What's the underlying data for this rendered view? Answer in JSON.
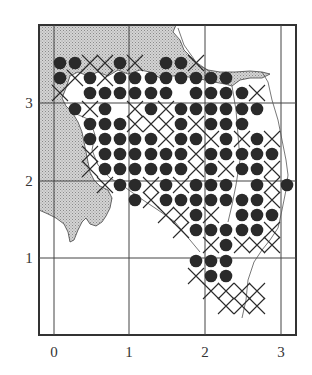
{
  "figure": {
    "x_axis": {
      "ticks": [
        "0",
        "1",
        "2",
        "3"
      ]
    },
    "y_axis": {
      "ticks": [
        "1",
        "2",
        "3"
      ]
    }
  },
  "colors": {
    "land": "#c8c8c8",
    "ink": "#2a2a2a",
    "background": "#ffffff"
  },
  "legend_semantics": {
    "dot": "filled-circle-marker",
    "cross": "x-marker"
  },
  "grid": {
    "cols_x": [
      60,
      75,
      90,
      105,
      120,
      135,
      151,
      166,
      181,
      196,
      211,
      226,
      242,
      257,
      272,
      287
    ],
    "rows_y": [
      63,
      78,
      93,
      109,
      124,
      139,
      154,
      169,
      185,
      200,
      215,
      230,
      245,
      261,
      276,
      291,
      306
    ]
  },
  "markers": {
    "rows": [
      {
        "dots": [
          0,
          1,
          4,
          7,
          8
        ],
        "crosses": [
          2,
          3,
          5,
          9
        ]
      },
      {
        "dots": [
          0,
          2,
          4,
          5,
          6,
          7,
          8,
          9,
          10,
          11
        ],
        "crosses": [
          1,
          3
        ]
      },
      {
        "dots": [
          2,
          3,
          4,
          5,
          6,
          7,
          9,
          10,
          11,
          12
        ],
        "crosses": [
          0,
          13
        ]
      },
      {
        "dots": [
          1,
          3,
          6,
          8,
          9,
          10,
          11,
          12,
          13
        ],
        "crosses": [
          2,
          5,
          7
        ]
      },
      {
        "dots": [
          2,
          3,
          4,
          8,
          10,
          11,
          12
        ],
        "crosses": [
          5,
          6,
          7,
          9
        ]
      },
      {
        "dots": [
          2,
          3,
          4,
          5,
          6,
          8,
          9,
          11,
          13
        ],
        "crosses": [
          7,
          10,
          12,
          14
        ]
      },
      {
        "dots": [
          3,
          4,
          5,
          6,
          7,
          8,
          10,
          11,
          12,
          13,
          14
        ],
        "crosses": [
          2,
          9
        ]
      },
      {
        "dots": [
          3,
          4,
          5,
          6,
          7,
          8,
          10,
          12,
          13
        ],
        "crosses": [
          2,
          9,
          11,
          14
        ]
      },
      {
        "dots": [
          4,
          5,
          7,
          9,
          10,
          11,
          13,
          15
        ],
        "crosses": [
          3,
          6,
          8,
          14
        ]
      },
      {
        "dots": [
          5,
          7,
          8,
          9,
          10,
          11,
          12,
          13
        ],
        "crosses": [
          6,
          14
        ]
      },
      {
        "dots": [
          9,
          12,
          13,
          14
        ],
        "crosses": [
          7,
          8,
          10
        ]
      },
      {
        "dots": [
          9,
          10,
          11,
          12,
          13
        ],
        "crosses": [
          8,
          14
        ]
      },
      {
        "dots": [
          11
        ],
        "crosses": [
          10,
          12,
          13,
          14
        ]
      },
      {
        "dots": [
          9,
          10,
          11
        ],
        "crosses": []
      },
      {
        "dots": [
          10,
          11
        ],
        "crosses": [
          9
        ]
      },
      {
        "dots": [],
        "crosses": [
          10,
          11,
          12,
          13
        ]
      },
      {
        "dots": [],
        "crosses": [
          11,
          12,
          13
        ]
      }
    ]
  }
}
